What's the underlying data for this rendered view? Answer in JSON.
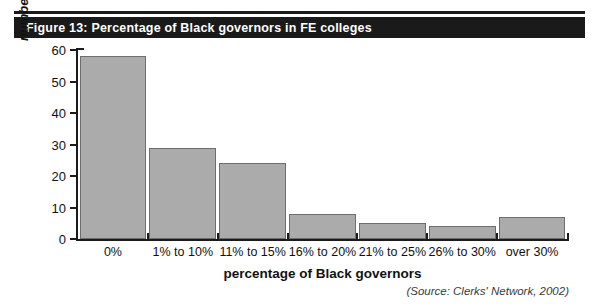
{
  "figure": {
    "title": "Figure 13: Percentage of Black governors in FE colleges",
    "source_note": "(Source: Clerks' Network, 2002)",
    "title_band_color": "#1a1a1a",
    "title_text_color": "#ffffff",
    "bar_fill_color": "#ababab",
    "bar_border_color": "#6e6e6e",
    "axis_color": "#1b1b1b"
  },
  "chart_data": {
    "type": "bar",
    "title": "Figure 13: Percentage of Black governors in FE colleges",
    "xlabel": "percentage of Black governors",
    "ylabel": "number of colleges",
    "categories": [
      "0%",
      "1% to 10%",
      "11% to 15%",
      "16% to 20%",
      "21% to 25%",
      "26% to 30%",
      "over 30%"
    ],
    "values": [
      58,
      29,
      24,
      8,
      5,
      4,
      7
    ],
    "ylim": [
      0,
      60
    ],
    "yticks": [
      0,
      10,
      20,
      30,
      40,
      50,
      60
    ],
    "ytick_labels": [
      "0",
      "10",
      "20",
      "30",
      "40",
      "50",
      "60"
    ],
    "grid": false,
    "legend": null,
    "series": [
      {
        "name": "number of colleges",
        "values": [
          58,
          29,
          24,
          8,
          5,
          4,
          7
        ]
      }
    ]
  }
}
